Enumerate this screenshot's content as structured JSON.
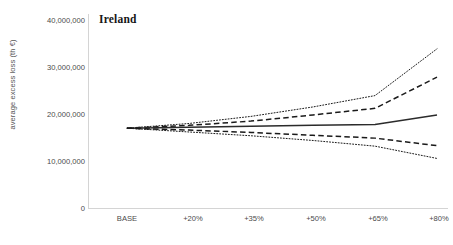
{
  "chart_data": {
    "type": "line",
    "title": "Ireland",
    "xlabel": "",
    "ylabel": "average excess loss (th €)",
    "categories": [
      "BASE",
      "+20%",
      "+35%",
      "+50%",
      "+65%",
      "+80%"
    ],
    "ylim": [
      0,
      40000000
    ],
    "yticks": [
      "0",
      "10,000,000",
      "20,000,000",
      "30,000,000",
      "40,000,000"
    ],
    "ytick_values": [
      0,
      10000000,
      20000000,
      30000000,
      40000000
    ],
    "grid": false,
    "legend": "none",
    "series": [
      {
        "name": "upper bound",
        "style": "dotted",
        "values": [
          17100000,
          18100000,
          19600000,
          21600000,
          24000000,
          33900000
        ]
      },
      {
        "name": "upper quartile",
        "style": "dashed",
        "values": [
          17100000,
          17700000,
          18600000,
          19900000,
          21300000,
          27900000
        ]
      },
      {
        "name": "mean",
        "style": "solid",
        "values": [
          17100000,
          17300000,
          17500000,
          17700000,
          17900000,
          19900000
        ]
      },
      {
        "name": "lower quartile",
        "style": "dashed",
        "values": [
          17100000,
          16700000,
          16200000,
          15600000,
          15000000,
          13400000
        ]
      },
      {
        "name": "lower bound",
        "style": "dotted",
        "values": [
          17100000,
          16300000,
          15500000,
          14500000,
          13300000,
          10700000
        ]
      }
    ]
  },
  "colors": {
    "axis": "#d4d4d4",
    "line": "#1a1a1a",
    "mean": "#2b2b2b",
    "text": "#4a4a4a",
    "title": "#161616",
    "background": "#ffffff"
  }
}
